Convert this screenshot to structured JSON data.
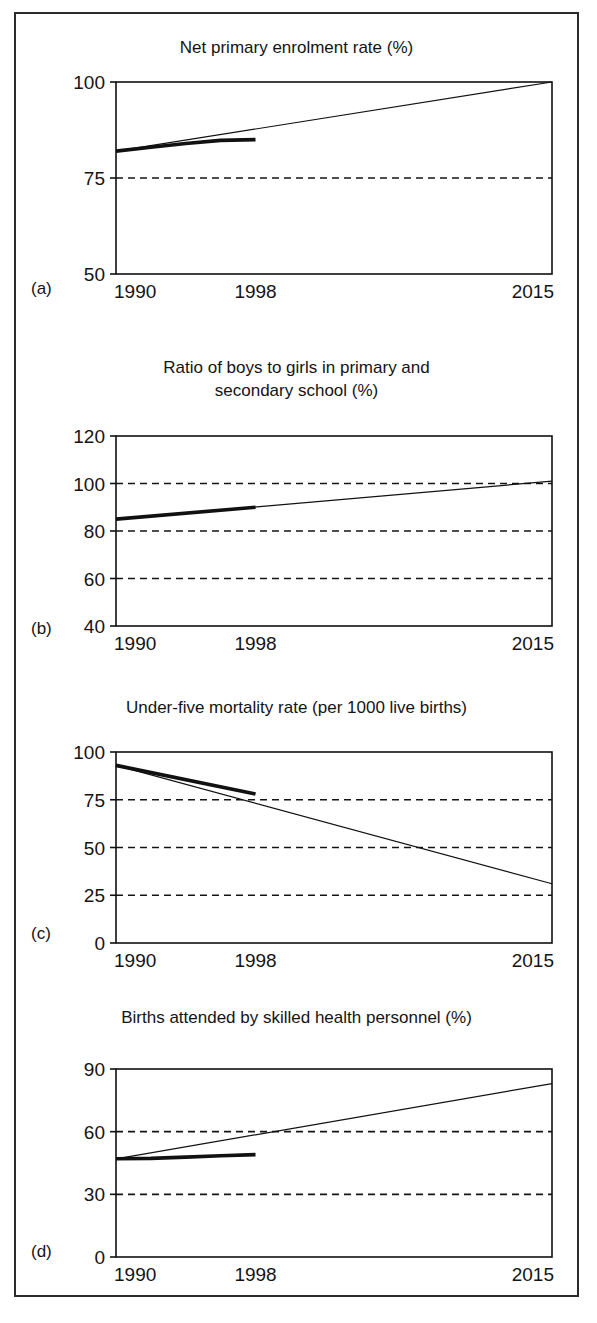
{
  "figure": {
    "background": "#ffffff",
    "border_color": "#2b2b2b",
    "line_color": "#111111",
    "grid_color": "#141414"
  },
  "chart_data": [
    {
      "type": "line",
      "tag": "(a)",
      "title": "Net primary enrolment rate (%)",
      "xlabel": "",
      "ylabel": "",
      "x_ticks": [
        "1990",
        "1998",
        "2015"
      ],
      "x_tick_values": [
        1990,
        1998,
        2015
      ],
      "xlim": [
        1990,
        2015
      ],
      "y_ticks": [
        "50",
        "75",
        "100"
      ],
      "y_tick_values": [
        50,
        75,
        100
      ],
      "ylim": [
        50,
        100
      ],
      "grid": "dashed horizontal at 75",
      "gridlines": [
        75
      ],
      "legend": "none",
      "series": [
        {
          "name": "observed trend (1990-1998)",
          "style": "thick",
          "x": [
            1990,
            1992,
            1994,
            1996,
            1998
          ],
          "values": [
            82,
            83,
            84,
            84.8,
            85
          ]
        },
        {
          "name": "target path to 2015",
          "style": "thin",
          "x": [
            1990,
            2015
          ],
          "values": [
            82,
            100
          ]
        }
      ]
    },
    {
      "type": "line",
      "tag": "(b)",
      "title": "Ratio of boys to girls in primary and\nsecondary school (%)",
      "xlabel": "",
      "ylabel": "",
      "x_ticks": [
        "1990",
        "1998",
        "2015"
      ],
      "x_tick_values": [
        1990,
        1998,
        2015
      ],
      "xlim": [
        1990,
        2015
      ],
      "y_ticks": [
        "40",
        "60",
        "80",
        "100",
        "120"
      ],
      "y_tick_values": [
        40,
        60,
        80,
        100,
        120
      ],
      "ylim": [
        40,
        120
      ],
      "grid": "dashed horizontal at 60, 80, 100",
      "gridlines": [
        60,
        80,
        100
      ],
      "legend": "none",
      "series": [
        {
          "name": "observed trend (1990-1998)",
          "style": "thick",
          "x": [
            1990,
            1998
          ],
          "values": [
            85,
            90
          ]
        },
        {
          "name": "target path to 2015",
          "style": "thin",
          "x": [
            1990,
            2015
          ],
          "values": [
            85,
            101
          ]
        }
      ]
    },
    {
      "type": "line",
      "tag": "(c)",
      "title": "Under-five mortality rate (per 1000 live births)",
      "xlabel": "",
      "ylabel": "",
      "x_ticks": [
        "1990",
        "1998",
        "2015"
      ],
      "x_tick_values": [
        1990,
        1998,
        2015
      ],
      "xlim": [
        1990,
        2015
      ],
      "y_ticks": [
        "0",
        "25",
        "50",
        "75",
        "100"
      ],
      "y_tick_values": [
        0,
        25,
        50,
        75,
        100
      ],
      "ylim": [
        0,
        100
      ],
      "grid": "dashed horizontal at 25, 50, 75",
      "gridlines": [
        25,
        50,
        75
      ],
      "legend": "none",
      "series": [
        {
          "name": "observed trend (1990-1998)",
          "style": "thick",
          "x": [
            1990,
            1998
          ],
          "values": [
            93,
            78
          ]
        },
        {
          "name": "target path to 2015",
          "style": "thin",
          "x": [
            1990,
            2015
          ],
          "values": [
            93,
            31
          ]
        }
      ]
    },
    {
      "type": "line",
      "tag": "(d)",
      "title": "Births attended by skilled health personnel (%)",
      "xlabel": "",
      "ylabel": "",
      "x_ticks": [
        "1990",
        "1998",
        "2015"
      ],
      "x_tick_values": [
        1990,
        1998,
        2015
      ],
      "xlim": [
        1990,
        2015
      ],
      "y_ticks": [
        "0",
        "30",
        "60",
        "90"
      ],
      "y_tick_values": [
        0,
        30,
        60,
        90
      ],
      "ylim": [
        0,
        90
      ],
      "grid": "dashed horizontal at 30, 60",
      "gridlines": [
        30,
        60
      ],
      "legend": "none",
      "series": [
        {
          "name": "observed trend (1990-1998)",
          "style": "thick",
          "x": [
            1990,
            1992,
            1994,
            1996,
            1998
          ],
          "values": [
            47,
            47.2,
            47.8,
            48.5,
            49
          ]
        },
        {
          "name": "target path to 2015",
          "style": "thin",
          "x": [
            1990,
            2015
          ],
          "values": [
            47,
            83
          ]
        }
      ]
    }
  ]
}
